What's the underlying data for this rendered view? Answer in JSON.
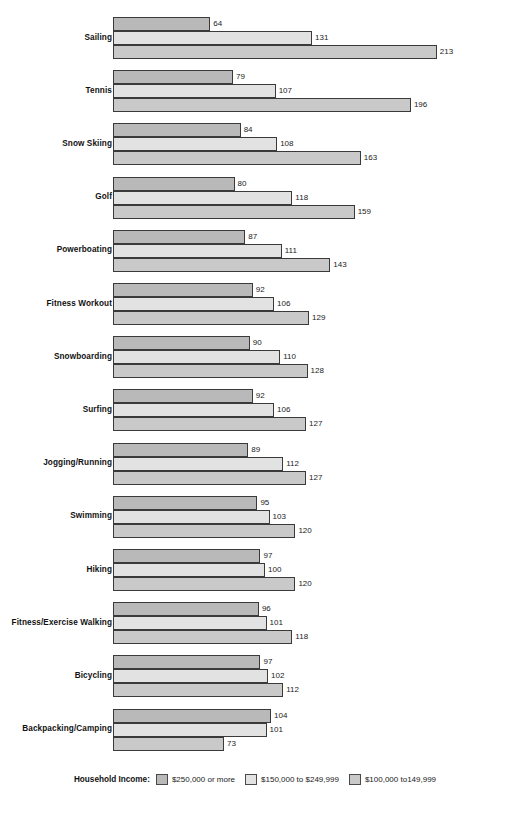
{
  "chart_data": {
    "type": "bar",
    "orientation": "horizontal",
    "title": "",
    "xlabel": "",
    "ylabel": "",
    "grid": false,
    "legend_position": "bottom",
    "legend_title": "Household Income:",
    "xlim": [
      0,
      213
    ],
    "value_labels_shown": true,
    "categories": [
      "Sailing",
      "Tennis",
      "Snow Skiing",
      "Golf",
      "Powerboating",
      "Fitness Workout",
      "Snowboarding",
      "Surfing",
      "Jogging/Running",
      "Swimming",
      "Hiking",
      "Fitness/Exercise Walking",
      "Bicycling",
      "Backpacking/Camping"
    ],
    "series": [
      {
        "name": "$250,000 or more",
        "color": "#b9b9b9",
        "values": [
          64,
          79,
          84,
          80,
          87,
          92,
          90,
          92,
          89,
          95,
          97,
          96,
          97,
          104
        ]
      },
      {
        "name": "$150,000 to $249,999",
        "color": "#e2e2e2",
        "values": [
          131,
          107,
          108,
          118,
          111,
          106,
          110,
          106,
          112,
          103,
          100,
          101,
          102,
          101
        ]
      },
      {
        "name": "$100,000 to149,999",
        "color": "#c9c9c9",
        "values": [
          213,
          196,
          163,
          159,
          143,
          129,
          128,
          127,
          127,
          120,
          120,
          118,
          112,
          73
        ]
      }
    ]
  },
  "legend": {
    "title": "Household Income:",
    "items": [
      {
        "label": "$250,000 or more",
        "swatch": "#b9b9b9"
      },
      {
        "label": "$150,000 to $249,999",
        "swatch": "#e2e2e2"
      },
      {
        "label": "$100,000 to149,999",
        "swatch": "#c9c9c9"
      }
    ]
  },
  "style": {
    "bar_border": "#3a3a3a",
    "text_color": "#1a1a1a",
    "background": "#ffffff"
  }
}
